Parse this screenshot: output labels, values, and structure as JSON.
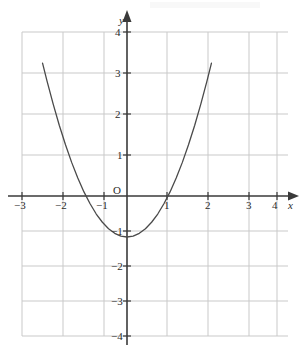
{
  "figure": {
    "kind": "cartesian-graph",
    "background_color": "#ffffff",
    "width_px": 303,
    "height_px": 363
  },
  "axes": {
    "x_axis_name": "x",
    "y_axis_name": "y",
    "origin_label": "O",
    "axis_color": "#3a3a3a",
    "grid_color": "#c9c9c9",
    "x_tick_labels": [
      "−3",
      "−2",
      "−1",
      "1",
      "2",
      "3",
      "4"
    ],
    "y_tick_labels": [
      "4",
      "3",
      "2",
      "1",
      "−1",
      "−2",
      "−3",
      "−4"
    ],
    "x_ticks": [
      -3,
      -2,
      -1,
      1,
      2,
      3,
      4
    ],
    "y_ticks": [
      4,
      3,
      2,
      1,
      -1,
      -2,
      -3,
      -4
    ]
  },
  "chart_data": {
    "type": "line",
    "title": "",
    "xlabel": "x",
    "ylabel": "y",
    "xlim": [
      -3.3,
      4.3
    ],
    "ylim": [
      -4.2,
      4.4
    ],
    "grid": true,
    "legend": "none",
    "series": [
      {
        "name": "y = x^2 - 1",
        "equation": "y = x² − 1",
        "color": "#4a4a4a",
        "line_width_px": 1.3,
        "vertex": [
          0,
          -1
        ],
        "roots": [
          -1,
          1
        ],
        "y_intercept": -1,
        "x_domain_drawn": [
          -2.06,
          2.06
        ],
        "x": [
          -2.06,
          -1.95,
          -1.8,
          -1.65,
          -1.5,
          -1.35,
          -1.2,
          -1.05,
          -0.9,
          -0.75,
          -0.6,
          -0.45,
          -0.3,
          -0.15,
          0,
          0.15,
          0.3,
          0.45,
          0.6,
          0.75,
          0.9,
          1.05,
          1.2,
          1.35,
          1.5,
          1.65,
          1.8,
          1.95,
          2.06
        ],
        "y": [
          3.24,
          2.8,
          2.24,
          1.72,
          1.25,
          0.82,
          0.44,
          0.1,
          -0.19,
          -0.44,
          -0.64,
          -0.8,
          -0.91,
          -0.98,
          -1,
          -0.98,
          -0.91,
          -0.8,
          -0.64,
          -0.44,
          -0.19,
          0.1,
          0.44,
          0.82,
          1.25,
          1.72,
          2.24,
          2.8,
          3.24
        ]
      }
    ],
    "annotations": [
      {
        "text": "O",
        "x": -0.25,
        "y": 0.3,
        "role": "origin-label"
      }
    ]
  },
  "geometry": {
    "x_axis_y_px": 196,
    "y_axis_x_px": 127,
    "unit_px_x": 41,
    "unit_px_y": 41,
    "grid_left_px": 22,
    "grid_right_px": 277,
    "grid_top_px": 32,
    "grid_bottom_px": 336
  }
}
